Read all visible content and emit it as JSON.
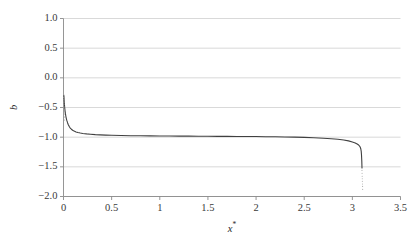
{
  "figure": {
    "width": 416,
    "height": 238,
    "background": "#ffffff"
  },
  "chart_data": {
    "type": "line",
    "title": "",
    "xlabel": "x*",
    "ylabel": "b",
    "xlim": [
      0,
      3.5
    ],
    "ylim": [
      -2.0,
      1.0
    ],
    "xticks": [
      0,
      0.5,
      1,
      1.5,
      2,
      2.5,
      3,
      3.5
    ],
    "xtick_labels": [
      "0",
      "0.5",
      "1",
      "1.5",
      "2",
      "2.5",
      "3",
      "3.5"
    ],
    "yticks": [
      1.0,
      0.5,
      0.0,
      -0.5,
      -1.0,
      -1.5,
      -2.0
    ],
    "ytick_labels": [
      "1.0",
      "0.5",
      "0.0",
      "−0.5",
      "−1.0",
      "−1.5",
      "−2.0"
    ],
    "grid": {
      "horizontal": true,
      "vertical": false,
      "color": "#cfcfcf"
    },
    "legend": null,
    "series": [
      {
        "name": "b(x*)",
        "color": "#404040",
        "linewidth": 1.1,
        "x": [
          0.004,
          0.008,
          0.012,
          0.016,
          0.02,
          0.025,
          0.03,
          0.036,
          0.042,
          0.05,
          0.06,
          0.07,
          0.082,
          0.095,
          0.11,
          0.13,
          0.15,
          0.175,
          0.2,
          0.24,
          0.28,
          0.33,
          0.38,
          0.44,
          0.5,
          0.6,
          0.7,
          0.8,
          0.9,
          1.0,
          1.1,
          1.2,
          1.3,
          1.4,
          1.5,
          1.6,
          1.7,
          1.8,
          1.9,
          2.0,
          2.1,
          2.2,
          2.3,
          2.4,
          2.5,
          2.6,
          2.7,
          2.78,
          2.85,
          2.91,
          2.96,
          3.0,
          3.03,
          3.05,
          3.065,
          3.075,
          3.082,
          3.088,
          3.092,
          3.095,
          3.098,
          3.1
        ],
        "y": [
          -0.3,
          -0.415,
          -0.495,
          -0.556,
          -0.604,
          -0.652,
          -0.69,
          -0.726,
          -0.756,
          -0.79,
          -0.822,
          -0.846,
          -0.866,
          -0.883,
          -0.898,
          -0.912,
          -0.921,
          -0.93,
          -0.937,
          -0.945,
          -0.951,
          -0.957,
          -0.961,
          -0.965,
          -0.968,
          -0.972,
          -0.975,
          -0.977,
          -0.979,
          -0.98,
          -0.981,
          -0.982,
          -0.983,
          -0.984,
          -0.985,
          -0.986,
          -0.987,
          -0.988,
          -0.989,
          -0.99,
          -0.992,
          -0.994,
          -0.996,
          -0.999,
          -1.003,
          -1.009,
          -1.018,
          -1.026,
          -1.036,
          -1.048,
          -1.062,
          -1.08,
          -1.098,
          -1.115,
          -1.132,
          -1.15,
          -1.17,
          -1.2,
          -1.24,
          -1.3,
          -1.4,
          -1.52
        ],
        "note": "hyperbolic-like branch: steep rise near x*=0 from about -0.3, flat plateau at b=-1.0, steep plunge near x*=3.1"
      }
    ],
    "scatter_overlays": [
      {
        "name": "left-edge-sparse-points",
        "color": "#9a9a9a",
        "x": [
          0.003,
          0.003,
          0.004,
          0.004,
          0.005,
          0.005,
          0.006,
          0.007,
          0.008,
          0.01,
          0.012
        ],
        "y": [
          -0.285,
          -0.33,
          -0.37,
          -0.41,
          -0.45,
          -0.49,
          -0.53,
          -0.57,
          -0.61,
          -0.66,
          -0.71
        ]
      },
      {
        "name": "right-edge-sparse-points",
        "color": "#b0b0b0",
        "x": [
          3.1,
          3.101,
          3.102,
          3.103,
          3.104,
          3.105,
          3.106,
          3.107
        ],
        "y": [
          -1.56,
          -1.61,
          -1.66,
          -1.7,
          -1.745,
          -1.79,
          -1.83,
          -1.88
        ]
      }
    ]
  }
}
